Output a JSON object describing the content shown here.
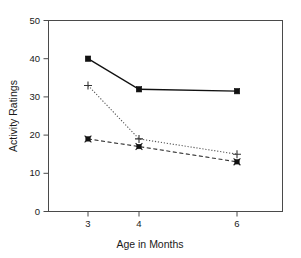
{
  "chart_data": {
    "type": "line",
    "title": "",
    "xlabel": "Age in Months",
    "ylabel": "Activity Ratings",
    "categories": [
      "3",
      "4",
      "6"
    ],
    "x": [
      3,
      4,
      6
    ],
    "xlim": [
      2.5,
      7.0
    ],
    "ylim": [
      0,
      50
    ],
    "yticks": [
      0,
      10,
      20,
      30,
      40,
      50
    ],
    "ytick_labels": [
      "0",
      "10",
      "20",
      "30",
      "40",
      "50"
    ],
    "xtick_labels": [
      "3",
      "4",
      "6"
    ],
    "grid": false,
    "legend": "none",
    "series": [
      {
        "name": "series-solid-square",
        "line_style": "solid",
        "marker": "filled-square",
        "color": "#111111",
        "values": [
          40,
          32,
          31.5
        ]
      },
      {
        "name": "series-dotted-plus",
        "line_style": "dotted",
        "marker": "plus",
        "color": "#555555",
        "values": [
          33,
          19,
          15
        ]
      },
      {
        "name": "series-dashed-x",
        "line_style": "dashed",
        "marker": "x-square",
        "color": "#333333",
        "values": [
          19,
          17,
          13
        ]
      }
    ]
  },
  "axes": {
    "y_axis_label": "Activity Ratings",
    "x_axis_label": "Age in Months",
    "y_tick_0": "0",
    "y_tick_10": "10",
    "y_tick_20": "20",
    "y_tick_30": "30",
    "y_tick_40": "40",
    "y_tick_50": "50",
    "x_tick_3": "3",
    "x_tick_4": "4",
    "x_tick_6": "6"
  }
}
